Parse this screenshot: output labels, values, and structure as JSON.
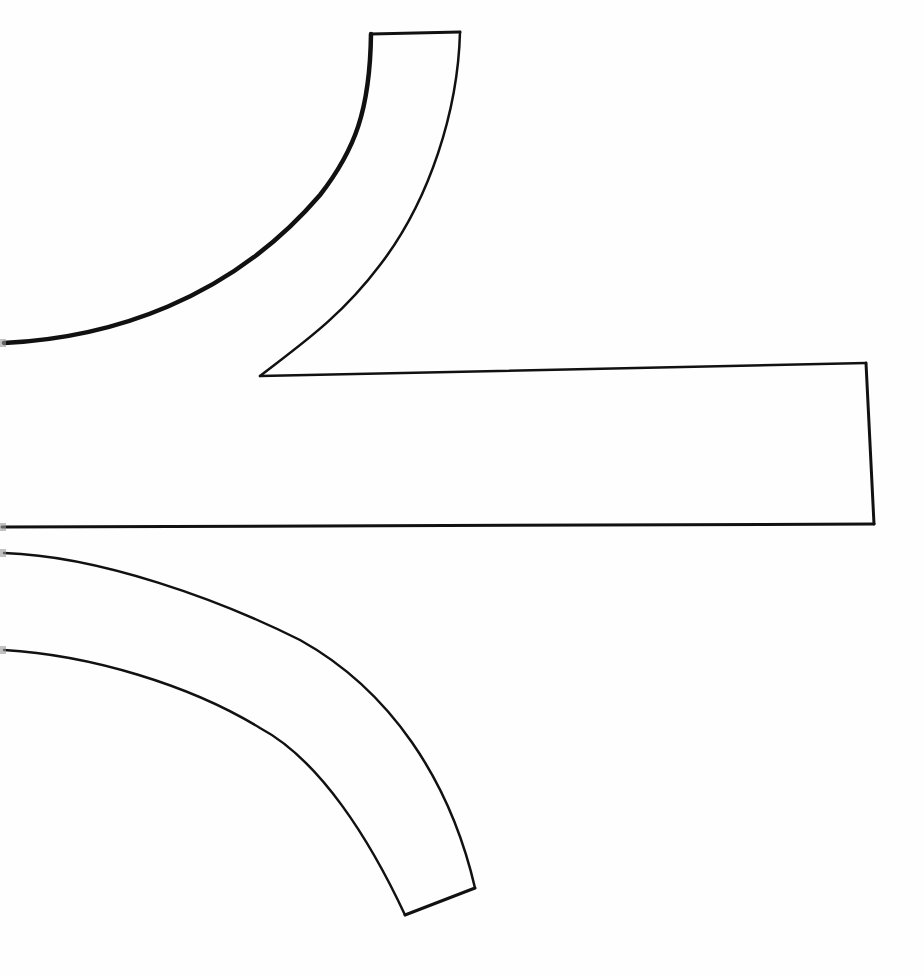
{
  "canvas": {
    "width": 924,
    "height": 975,
    "background": "#fefefe",
    "ink_color": "#111111"
  },
  "shapes": [
    {
      "id": "upper-curved-arm",
      "description": "Upward-curving band from the left edge ending in a flat top cap",
      "segments": {
        "inner_curve": "M 4 343 C 110 338, 230 300, 320 195 C 355 150, 370 110, 371 34",
        "top_cap": "M 371 34 L 460 32",
        "outer_curve": "M 460 32 C 458 110, 430 200, 380 265 C 340 318, 300 345, 260 376"
      },
      "stroke_widths": {
        "inner_curve": 4.5,
        "top_cap": 3,
        "outer_curve": 2.5
      }
    },
    {
      "id": "horizontal-bar",
      "description": "Long horizontal rectangle extending from the left edge to the right",
      "segments": {
        "top_edge": "M 260 376 L 866 363",
        "right_edge": "M 866 363 L 874 524",
        "bottom_edge": "M 874 524 L 2 527"
      },
      "stroke_widths": {
        "top_edge": 2.5,
        "right_edge": 3,
        "bottom_edge": 3
      }
    },
    {
      "id": "lower-curved-arm",
      "description": "Downward-curving band from the left edge ending in a slanted bottom cap",
      "segments": {
        "upper_curve": "M 4 553 C 100 556, 220 600, 300 640 C 390 690, 450 780, 475 888",
        "bottom_cap": "M 475 888 L 405 915",
        "lower_curve": "M 405 915 C 370 840, 320 760, 260 728 C 190 685, 90 655, 4 650"
      },
      "stroke_widths": {
        "upper_curve": 2.5,
        "bottom_cap": 3,
        "lower_curve": 2.5
      }
    }
  ],
  "edge_marks": [
    {
      "x": 0,
      "y": 339,
      "w": 6,
      "h": 8
    },
    {
      "x": 0,
      "y": 523,
      "w": 6,
      "h": 8
    },
    {
      "x": 0,
      "y": 549,
      "w": 6,
      "h": 8
    },
    {
      "x": 0,
      "y": 646,
      "w": 6,
      "h": 8
    }
  ]
}
